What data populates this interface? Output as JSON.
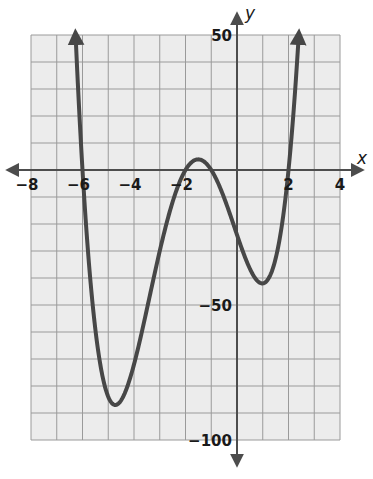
{
  "chart_data": {
    "type": "line",
    "title": "",
    "xlabel": "x",
    "ylabel": "y",
    "xlim": [
      -8,
      4
    ],
    "ylim": [
      -100,
      50
    ],
    "grid": true,
    "x_grid_step": 1,
    "y_grid_step": 10,
    "x_ticks": [
      -8,
      -6,
      -4,
      -2,
      2,
      4
    ],
    "x_tick_labels": [
      "−8",
      "−6",
      "−4",
      "−2",
      "2",
      "4"
    ],
    "y_ticks": [
      50,
      -50,
      -100
    ],
    "y_tick_labels": [
      "50",
      "−50",
      "−100"
    ],
    "function": "f(x) = (x+6)(x+2)(x+1)(x-2)",
    "roots": [
      -6,
      -2,
      -1,
      2
    ],
    "local_extrema": [
      {
        "type": "min",
        "x": -4.5,
        "y": -85
      },
      {
        "type": "max",
        "x": -1.5,
        "y": 4
      },
      {
        "type": "min",
        "x": 1,
        "y": -42
      }
    ],
    "series": [
      {
        "name": "f(x)",
        "x": [
          -6.35,
          -6,
          -5.5,
          -5,
          -4.5,
          -4,
          -3.5,
          -3,
          -2.5,
          -2,
          -1.5,
          -1,
          -0.5,
          0,
          0.5,
          1,
          1.5,
          2,
          2.35
        ],
        "y": [
          50,
          0,
          -42,
          -72,
          -85,
          -84,
          -72,
          -50,
          -30,
          0,
          4,
          0,
          -18,
          -24,
          -33,
          -42,
          -36,
          0,
          50
        ]
      }
    ],
    "end_arrows": true,
    "colors": {
      "curve": "#474747",
      "axis": "#4d4d4d",
      "grid": "#9a9a9a",
      "background": "#ececec"
    }
  }
}
